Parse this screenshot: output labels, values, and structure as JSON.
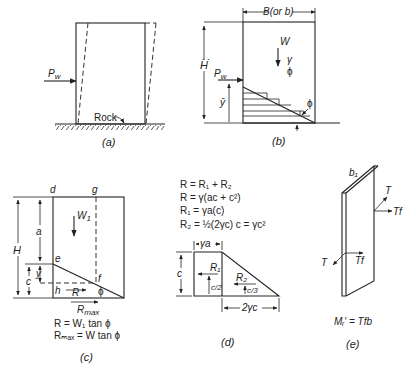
{
  "figure": {
    "panels": {
      "a": {
        "caption": "(a)",
        "force_label": "P",
        "force_sub": "w",
        "ground_label": "Rock"
      },
      "b": {
        "caption": "(b)",
        "width_label": "B(or b)",
        "height_label": "H",
        "weight_label": "W",
        "gamma_label": "γ",
        "phi_label": "ϕ",
        "force_label": "P",
        "force_sub": "w",
        "ybar_label": "ȳ",
        "slope_phi_label": "ϕ"
      },
      "c": {
        "caption": "(c)",
        "corner_d": "d",
        "corner_g": "g",
        "point_e": "e",
        "point_f": "f",
        "point_h": "h",
        "height_label": "H",
        "a_label": "a",
        "c_label": "c",
        "y_label": "y",
        "weight_label": "W",
        "weight_sub": "1",
        "r_label": "R",
        "phi_label": "ϕ",
        "rmax_label": "R",
        "rmax_sub": "max",
        "eq1": "R = W₁ tan ϕ",
        "eq2": "Rₘₐₓ = W tan ϕ"
      },
      "d": {
        "caption": "(d)",
        "eq1": "R = R₁ + R₂",
        "eq2": "R = γ(ac + c²)",
        "eq3": "R₁ = γa(c)",
        "eq4": "R₂ = ½(2γc) c = γc²",
        "top_dim": "γa",
        "side_dim": "c",
        "bottom_dim": "2γc",
        "r1_label": "R₁",
        "r1_arm": "c/2",
        "r2_label": "R₂",
        "r2_arm": "c/3"
      },
      "e": {
        "caption": "(e)",
        "plate_label": "b₁",
        "t_label_top": "T",
        "tf_label_top": "Tf",
        "t_label_bottom": "T",
        "tf_label_bottom": "Tf",
        "moment_eq": "Mᵣ' = Tfb"
      }
    }
  }
}
